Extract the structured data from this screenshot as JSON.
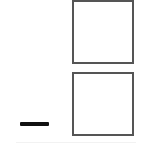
{
  "figure": {
    "top_box": {
      "label": ""
    },
    "bottom_box": {
      "label": ""
    },
    "dash": {
      "symbol": "—"
    },
    "colors": {
      "background": "#ffffff",
      "box_border": "#555555",
      "dash": "#111111"
    }
  }
}
